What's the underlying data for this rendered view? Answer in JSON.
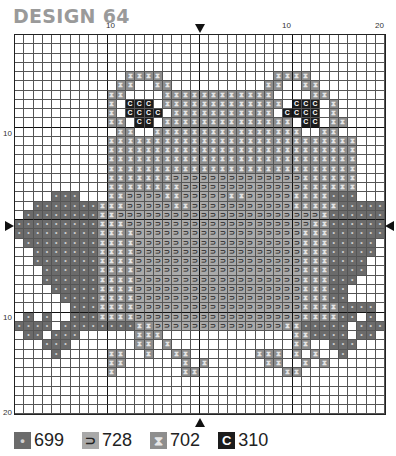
{
  "title": "DESIGN 64",
  "axis": {
    "top_labels": [
      {
        "text": "10",
        "x": 106
      },
      {
        "text": "10",
        "x": 282
      },
      {
        "text": "20",
        "x": 375
      }
    ],
    "side_labels": [
      {
        "text": "10",
        "y": 129
      },
      {
        "text": "10",
        "y": 313
      },
      {
        "text": "20",
        "y": 408
      }
    ]
  },
  "markers": {
    "top_center": "down-arrow",
    "bottom_center": "up-arrow",
    "left_middle": "right-arrow",
    "right_middle": "left-arrow"
  },
  "symbols": {
    "d": {
      "code": "699",
      "glyph": "•",
      "color": "#6b6b6b"
    },
    "b": {
      "code": "728",
      "glyph": "⊃",
      "color": "#a9a9a9"
    },
    "x": {
      "code": "702",
      "glyph": "⧗",
      "color": "#8e8e8e"
    },
    "c": {
      "code": "310",
      "glyph": "C",
      "color": "#1c1c1c"
    }
  },
  "legend": [
    {
      "key": "d",
      "glyph": "•",
      "label": "699"
    },
    {
      "key": "b",
      "glyph": "⊃",
      "label": "728"
    },
    {
      "key": "x",
      "glyph": "⧗",
      "label": "702"
    },
    {
      "key": "c",
      "glyph": "C",
      "label": "310"
    }
  ],
  "pattern": [
    "........................................",
    "........................................",
    "........................................",
    "........................................",
    "............xxxx............xxxx........",
    "...........xx..xx..........xx..xx.......",
    "..........xx....xxxxxxxxxxxx....xx......",
    "..........x.ccc.xxxxxxxxxxxxx.ccc.x.....",
    "..........x.cccc.xxxxxxxxxxx.cccc.x.....",
    "..........xx.cc.xxxxxxxxxxxxxx.cc.xx....",
    "...........xx..xxxxxxxxxxxxxxxx..xx.....",
    "..........xxxxxxxxxxxxxxxxxxxxxxxxxxx...",
    "..........xxxxxxxxxxxxxxxxxxxxxxxxxxx...",
    "..........xxxxxxxxxxxxxxxxxxxxxxxxxxx...",
    "..........xxxxxxxxxxxxxxxxxxxxxxxxxxx...",
    "..........xxxxxxxbbbbbbbbbbbbbbxxxxxx...",
    "..........xxxxxxxxbbbbbbbbbbbbbxxxxxx...",
    "....ddd...xxbbbbxxbbbbbxxbbbbbxxxxddd...",
    "..dddddddxxxbbbbbxxbbbbbbbbbbbxxxxxddddd",
    ".ddddddddxxbbbbbbbbbbbbbbbbbbbbbbxdddddd",
    "dddddddddxxxbbbbbbbbbbbbbbbbbbbbxxdddddd",
    "dddddddddxxxxbbbbbbbbbbbbbbbbbbxxxdddddd",
    ".ddddddddxxxxbbbbbbbbbbbbbbbbbbxxxddddd.",
    "..dddddddxxxxbbbbbbbbbbbbbbbbbbxxxddddd.",
    "..dddddddxxxxbbbbbbbbbbbbbbbbbbxxxdddd..",
    "...ddddddxxxxbbbbbbbbbbbbbbbbbbxxxdddd..",
    "...ddddddxxxxbbbbbbbbbbbbbbbbbbxxxddd...",
    "....dddddxxxxbbbbbbbbbbbbbbbbbbxxxdd....",
    ".....ddddxxxxbbbbbbbbbbbbbbbbbbxxxdd....",
    "......dddxxxxbbbbbbbbbbbbbbbbbbxxxxdddd.",
    ".d.d..dddxxxxbbbbbbbbbbbbbbbbbbxxxxdd.d.",
    "dddd.ddddddddxxbbbbbbbbbbbbbbxxddddd.ddd",
    ".dd.ddd......xxx..............xxdddd.dd.",
    "...ddd.......xx.x.............xx..ddd...",
    "....d.....xx..x..xx.......xxx.x.x..d....",
    "..........xx......x.x......xx..x.x......",
    "..........x.......xx.........xx.........",
    "........................................",
    "........................................",
    "........................................",
    "........................................"
  ]
}
